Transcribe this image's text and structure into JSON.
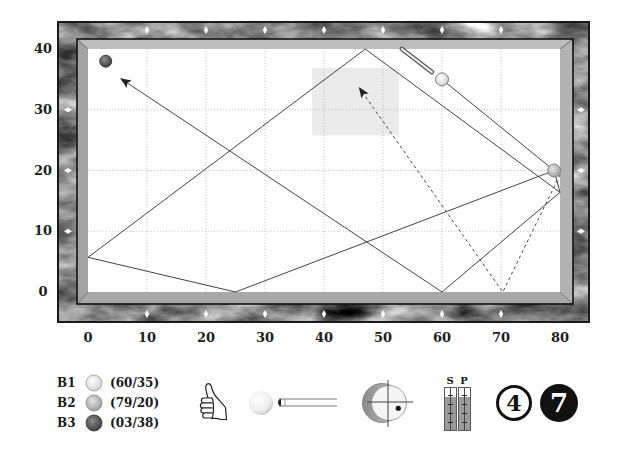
{
  "diagram": {
    "table_size": [
      80,
      40
    ],
    "grid_step": 10,
    "x_ticks": [
      "0",
      "10",
      "20",
      "30",
      "40",
      "50",
      "60",
      "70",
      "80"
    ],
    "y_ticks": [
      "40",
      "30",
      "20",
      "10",
      "0"
    ],
    "balls": [
      {
        "id": "B1",
        "x": 60,
        "y": 35,
        "fill": "#ffffff",
        "shade": "#cfcfcf",
        "stroke": "#6e6e6e",
        "r": 6.5
      },
      {
        "id": "B2",
        "x": 79,
        "y": 20,
        "fill": "#e4e4e4",
        "shade": "#9c9c9c",
        "stroke": "#7a7a7a",
        "r": 6.5
      },
      {
        "id": "B3",
        "x": 3,
        "y": 38,
        "fill": "#8c8c8c",
        "shade": "#3c3c3c",
        "stroke": "#333333",
        "r": 6
      }
    ],
    "paths": [
      {
        "name": "cue-ball-to-b2-path",
        "style": "solid",
        "arrow": false,
        "points": [
          [
            60,
            35
          ],
          [
            79,
            20
          ]
        ]
      },
      {
        "name": "cue-ball-path-to-b3",
        "style": "solid",
        "arrow": true,
        "points": [
          [
            79,
            20
          ],
          [
            80,
            16.4
          ],
          [
            60,
            0
          ],
          [
            5.6,
            35.1
          ]
        ]
      },
      {
        "name": "alternate-cushion-path",
        "style": "solid",
        "arrow": false,
        "points": [
          [
            80,
            16.4
          ],
          [
            47,
            40
          ],
          [
            0,
            5.7
          ],
          [
            25,
            0
          ],
          [
            79,
            20
          ]
        ]
      },
      {
        "name": "object-ball-path",
        "style": "dashed",
        "arrow": true,
        "points": [
          [
            80,
            19.3
          ],
          [
            70.3,
            0
          ],
          [
            46,
            33.6
          ]
        ]
      }
    ],
    "target_zone": {
      "x_min": 38,
      "x_max": 52.7,
      "y_min": 25.8,
      "y_max": 36.9,
      "color": "#ebebeb"
    },
    "cue_stick": {
      "from": [
        53.2,
        40
      ],
      "to": [
        58.3,
        36.2
      ]
    },
    "diamonds": {
      "x": [
        10,
        20,
        30,
        40,
        50,
        60,
        70
      ],
      "y": [
        10,
        20,
        30
      ]
    },
    "colors": {
      "line": "#2e2e2e",
      "grid": "#b9b9b9",
      "rail": "#8c8c8c",
      "cushion": "#b0b0b0",
      "cloth": "#ffffff"
    }
  },
  "legend": {
    "balls": [
      {
        "label": "B1",
        "coords": "(60/35)"
      },
      {
        "label": "B2",
        "coords": "(79/20)"
      },
      {
        "label": "B3",
        "coords": "(03/38)"
      }
    ]
  },
  "shot": {
    "rating_icon": "thumbs-up-icon",
    "cue_icon": "cue-ball-and-stick-icon",
    "spin": {
      "x": 0.53,
      "y": -0.3
    },
    "gauges": [
      {
        "label": "S",
        "fill": 0.78
      },
      {
        "label": "P",
        "fill": 0.78
      }
    ],
    "number_outlined": "4",
    "number_filled": "7"
  }
}
